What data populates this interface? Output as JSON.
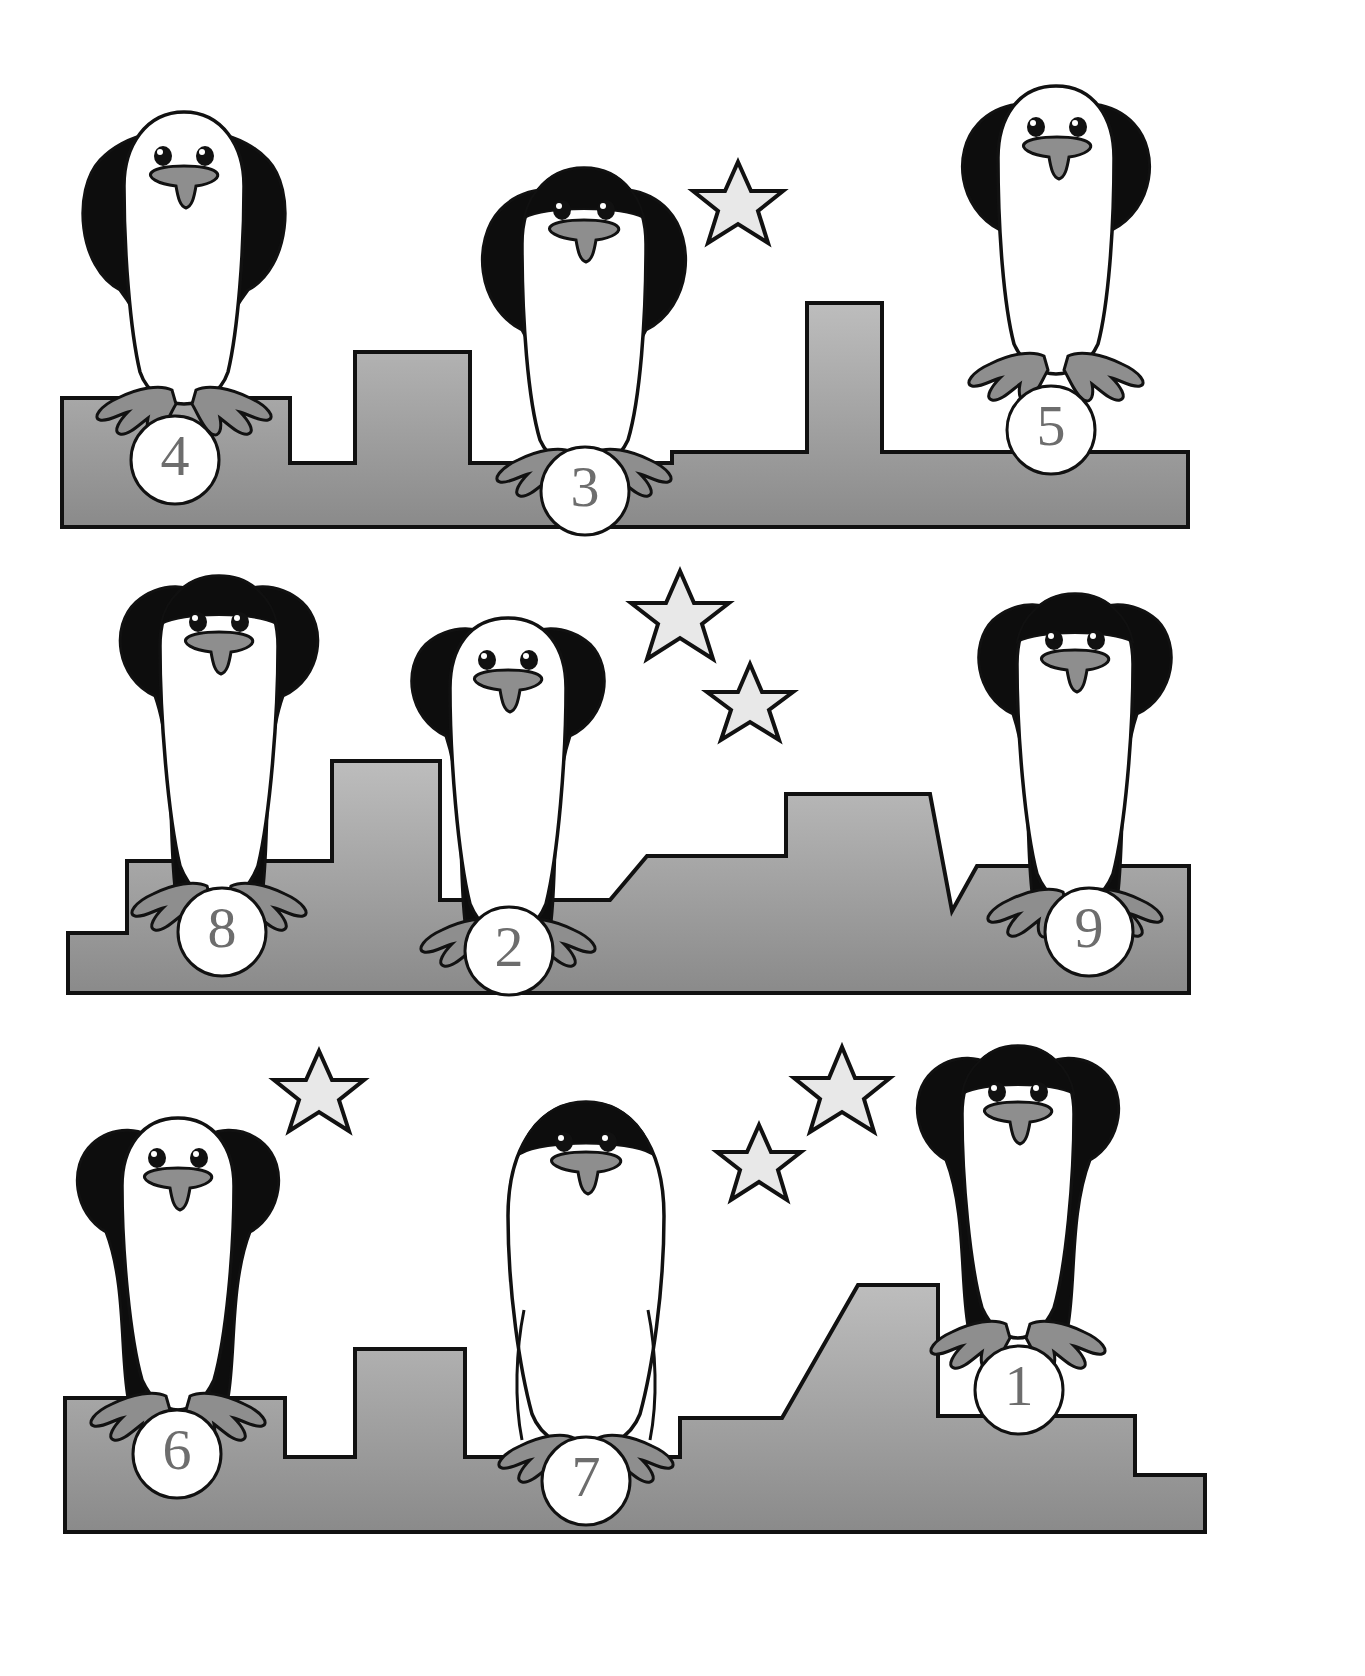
{
  "worksheet": {
    "title": "Penguins on Ice Numbered Worksheet",
    "background_color": "#ffffff",
    "ice_fill_top": "#b4b4b4",
    "ice_fill_bottom": "#8c8c8c",
    "star_fill": "#e8e8e8",
    "outline_color": "#111111",
    "penguin_body_black": "#0d0d0d",
    "penguin_belly_white": "#ffffff",
    "beak_foot_gray": "#8e8e8e",
    "circle_fill": "#ffffff",
    "handwriting_color": "#6d6d6d"
  },
  "rows": [
    {
      "id": "row-1",
      "label": "Row 1",
      "penguins": [
        {
          "id": "penguin-4",
          "number": "4",
          "head": "white",
          "pose": "wings-down"
        },
        {
          "id": "penguin-3",
          "number": "3",
          "head": "black-cap",
          "pose": "wings-round"
        },
        {
          "id": "penguin-5",
          "number": "5",
          "head": "white",
          "pose": "wings-round"
        }
      ],
      "stars": [
        {
          "id": "star-r1-a",
          "cx": 738,
          "cy": 208,
          "r": 46
        }
      ]
    },
    {
      "id": "row-2",
      "label": "Row 2",
      "penguins": [
        {
          "id": "penguin-8",
          "number": "8",
          "head": "black-cap",
          "pose": "wings-down"
        },
        {
          "id": "penguin-2",
          "number": "2",
          "head": "white",
          "pose": "wings-down"
        },
        {
          "id": "penguin-9",
          "number": "9",
          "head": "black-cap",
          "pose": "wings-down"
        }
      ],
      "stars": [
        {
          "id": "star-r2-a",
          "cx": 680,
          "cy": 620,
          "r": 50
        },
        {
          "id": "star-r2-b",
          "cx": 750,
          "cy": 706,
          "r": 43
        }
      ]
    },
    {
      "id": "row-3",
      "label": "Row 3",
      "penguins": [
        {
          "id": "penguin-6",
          "number": "6",
          "head": "white",
          "pose": "wings-down"
        },
        {
          "id": "penguin-7",
          "number": "7",
          "head": "black-cap",
          "pose": "no-wings"
        },
        {
          "id": "penguin-1",
          "number": "1",
          "head": "black-cap",
          "pose": "wings-down"
        }
      ],
      "stars": [
        {
          "id": "star-r3-a",
          "cx": 319,
          "cy": 1097,
          "r": 46
        },
        {
          "id": "star-r3-b",
          "cx": 842,
          "cy": 1095,
          "r": 48
        },
        {
          "id": "star-r3-c",
          "cx": 759,
          "cy": 1167,
          "r": 42
        }
      ]
    }
  ],
  "numbers_visible": [
    "4",
    "3",
    "5",
    "8",
    "2",
    "9",
    "6",
    "7",
    "1"
  ]
}
